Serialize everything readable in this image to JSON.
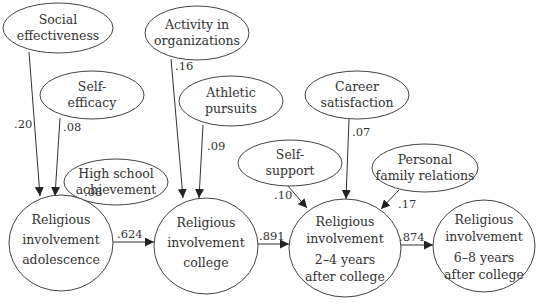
{
  "diagram": {
    "type": "path-model",
    "nodes": [
      {
        "id": "social",
        "lines": [
          "Social",
          "effectiveness"
        ],
        "shape": "ellipse",
        "cx": 58,
        "cy": 28,
        "rx": 55,
        "ry": 25
      },
      {
        "id": "selfeff",
        "lines": [
          "Self-",
          "efficacy"
        ],
        "shape": "ellipse",
        "cx": 92,
        "cy": 95,
        "rx": 52,
        "ry": 24
      },
      {
        "id": "hs",
        "lines": [
          "High school",
          "achievement"
        ],
        "shape": "ellipse",
        "cx": 116,
        "cy": 182,
        "rx": 52,
        "ry": 23
      },
      {
        "id": "activity",
        "lines": [
          "Activity in",
          "organizations"
        ],
        "shape": "ellipse",
        "cx": 197,
        "cy": 33,
        "rx": 52,
        "ry": 27
      },
      {
        "id": "athletic",
        "lines": [
          "Athletic",
          "pursuits"
        ],
        "shape": "ellipse",
        "cx": 231,
        "cy": 101,
        "rx": 52,
        "ry": 25
      },
      {
        "id": "career",
        "lines": [
          "Career",
          "satisfaction"
        ],
        "shape": "ellipse",
        "cx": 357,
        "cy": 95,
        "rx": 52,
        "ry": 24
      },
      {
        "id": "selfsup",
        "lines": [
          "Self-",
          "support"
        ],
        "shape": "ellipse",
        "cx": 290,
        "cy": 163,
        "rx": 52,
        "ry": 23
      },
      {
        "id": "family",
        "lines": [
          "Personal",
          "family relations"
        ],
        "shape": "ellipse",
        "cx": 425,
        "cy": 168,
        "rx": 53,
        "ry": 24
      },
      {
        "id": "ri_adol",
        "lines": [
          "Religious",
          "involvement",
          "adolescence"
        ],
        "shape": "circle",
        "cx": 61,
        "cy": 243,
        "rx": 52,
        "ry": 48
      },
      {
        "id": "ri_college",
        "lines": [
          "Religious",
          "involvement",
          "college"
        ],
        "shape": "circle",
        "cx": 206,
        "cy": 246,
        "rx": 52,
        "ry": 48
      },
      {
        "id": "ri_24",
        "lines": [
          "Religious",
          "involvement",
          "2–4 years",
          "after college"
        ],
        "shape": "circle",
        "cx": 345,
        "cy": 248,
        "rx": 56,
        "ry": 49
      },
      {
        "id": "ri_68",
        "lines": [
          "Religious",
          "involvement",
          "6–8 years",
          "after college"
        ],
        "shape": "circle",
        "cx": 484,
        "cy": 246,
        "rx": 51,
        "ry": 46
      }
    ],
    "edges": [
      {
        "from": "social",
        "to": "ri_adol",
        "coef": ".20",
        "x1": 29,
        "y1": 52,
        "x2": 40,
        "y2": 196,
        "lx": 14,
        "ly": 128
      },
      {
        "from": "selfeff",
        "to": "ri_adol",
        "coef": ".08",
        "x1": 60,
        "y1": 118,
        "x2": 55,
        "y2": 196,
        "lx": 63,
        "ly": 131
      },
      {
        "from": "hs",
        "to": "ri_adol",
        "coef": ".08",
        "x1": 84,
        "y1": 205,
        "x2": 71,
        "y2": 196,
        "lx": 84,
        "ly": 196
      },
      {
        "from": "activity",
        "to": "ri_college",
        "coef": ".16",
        "x1": 171,
        "y1": 59,
        "x2": 183,
        "y2": 198,
        "lx": 175,
        "ly": 70
      },
      {
        "from": "athletic",
        "to": "ri_college",
        "coef": ".09",
        "x1": 203,
        "y1": 125,
        "x2": 199,
        "y2": 198,
        "lx": 207,
        "ly": 150
      },
      {
        "from": "career",
        "to": "ri_24",
        "coef": ".07",
        "x1": 349,
        "y1": 119,
        "x2": 346,
        "y2": 199,
        "lx": 352,
        "ly": 136
      },
      {
        "from": "selfsup",
        "to": "ri_24",
        "coef": ".10",
        "x1": 288,
        "y1": 186,
        "x2": 307,
        "y2": 208,
        "lx": 274,
        "ly": 199
      },
      {
        "from": "family",
        "to": "ri_24",
        "coef": ".17",
        "x1": 399,
        "y1": 190,
        "x2": 381,
        "y2": 209,
        "lx": 398,
        "ly": 208
      },
      {
        "from": "ri_adol",
        "to": "ri_college",
        "coef": ".624",
        "x1": 113,
        "y1": 242,
        "x2": 154,
        "y2": 242,
        "lx": 117,
        "ly": 238
      },
      {
        "from": "ri_college",
        "to": "ri_24",
        "coef": ".891",
        "x1": 258,
        "y1": 244,
        "x2": 289,
        "y2": 244,
        "lx": 259,
        "ly": 240
      },
      {
        "from": "ri_24",
        "to": "ri_68",
        "coef": ".874",
        "x1": 401,
        "y1": 245,
        "x2": 433,
        "y2": 245,
        "lx": 399,
        "ly": 241
      }
    ]
  }
}
